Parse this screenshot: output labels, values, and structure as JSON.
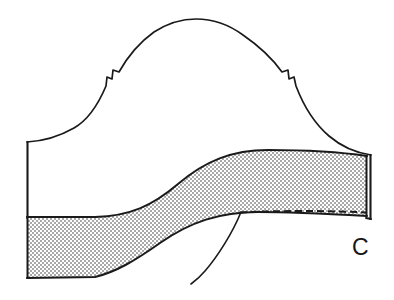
{
  "figure": {
    "background_color": "#ffffff",
    "ink_color": "#1a1a1a",
    "shading_color": "#c9c9c9",
    "shading_pattern": "fine-halftone-dot-screen",
    "width": 394,
    "height": 300
  },
  "labels": [
    {
      "id": "label-c",
      "text": "C",
      "x": 352,
      "y": 255,
      "font_size": 23,
      "color": "#161616"
    }
  ],
  "parts": {
    "arch_outline": {
      "name": "arched dome profile",
      "apex": {
        "x": 195,
        "y": 19
      },
      "left_notch": {
        "x": 112,
        "y": 73
      },
      "right_notch": {
        "x": 294,
        "y": 73
      },
      "left_shoulder": {
        "x": 27,
        "y": 142
      },
      "right_shoulder": {
        "x": 371,
        "y": 155
      },
      "stroke_width": 1.7
    },
    "left_edge": {
      "name": "left vertical edge",
      "x": 27,
      "y_top": 142,
      "y_bottom": 217,
      "stroke_width": 2.1
    },
    "right_edge": {
      "name": "right vertical edge",
      "x": 371,
      "y_top": 155,
      "y_bottom": 218,
      "stroke_width": 2.1
    },
    "shaded_band": {
      "name": "swept shaded band",
      "fill": "#c9c9c9",
      "left_top_y": 217,
      "left_bottom_y": 278,
      "right_top_y": 156,
      "right_bottom_y": 216,
      "right_x": 367,
      "left_x": 27,
      "stroke_width": 2.0
    },
    "dashed_line": {
      "name": "hidden edge dashed line",
      "x_start": 240,
      "x_end": 366,
      "y": 212,
      "dash_pattern": "7,4",
      "stroke_width": 2.0
    },
    "leader_line": {
      "name": "leader line to band edge",
      "from": {
        "x": 241,
        "y": 212
      },
      "to": {
        "x": 191,
        "y": 284
      },
      "stroke_width": 1.6
    }
  }
}
